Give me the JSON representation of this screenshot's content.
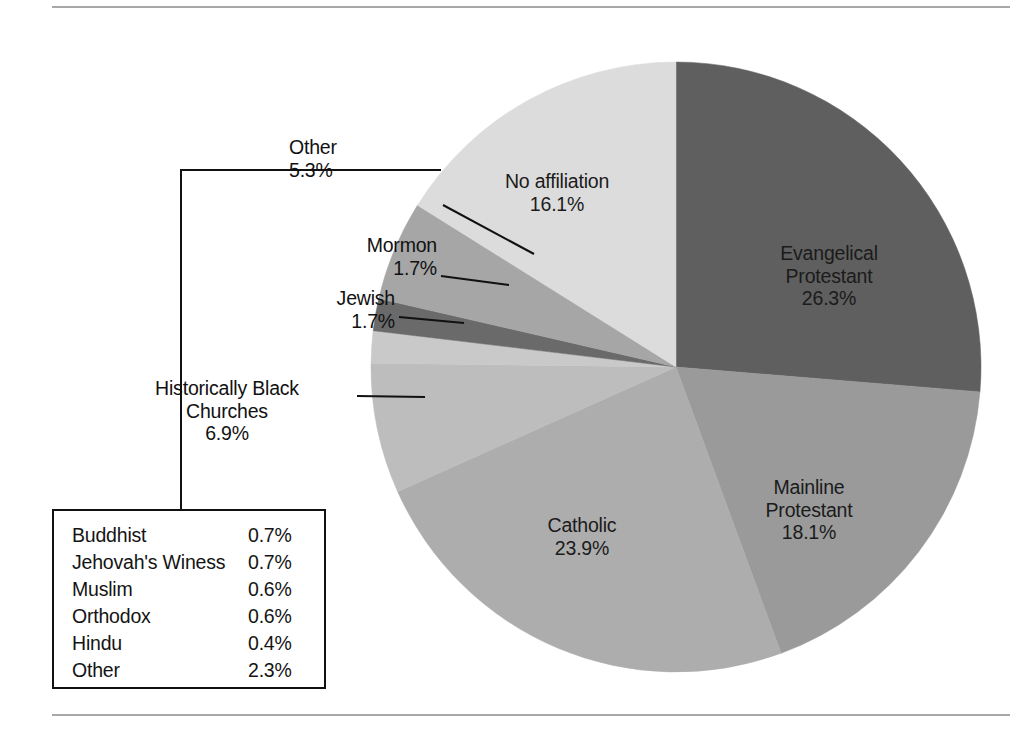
{
  "chart_data": {
    "type": "pie",
    "title": "",
    "start_angle_deg": 0,
    "direction": "clockwise",
    "center": {
      "x": 676,
      "y": 367
    },
    "radius": 305,
    "labels": [
      "Evangelical Protestant",
      "Mainline Protestant",
      "Catholic",
      "Historically Black Churches",
      "Jewish",
      "Mormon",
      "Other",
      "No affiliation"
    ],
    "values": [
      26.3,
      18.1,
      23.9,
      6.9,
      1.7,
      1.7,
      5.3,
      16.1
    ],
    "value_suffix": "%",
    "colors": [
      "#5f5f5f",
      "#9a9a9a",
      "#adadad",
      "#bdbdbd",
      "#c9c9c9",
      "#6a6a6a",
      "#a6a6a6",
      "#dcdcdc"
    ],
    "legend_position": "inside-slices-and-callouts",
    "grid": false,
    "sub_breakdown": {
      "parent": "Other",
      "rows": [
        {
          "label": "Buddhist",
          "value": "0.7%"
        },
        {
          "label": "Jehovah's Winess",
          "value": "0.7%"
        },
        {
          "label": "Muslim",
          "value": "0.6%"
        },
        {
          "label": "Orthodox",
          "value": "0.6%"
        },
        {
          "label": "Hindu",
          "value": "0.4%"
        },
        {
          "label": "Other",
          "value": "2.3%"
        }
      ]
    }
  },
  "slice_labels": {
    "no_affiliation": {
      "name": "No affiliation",
      "value": "16.1%"
    },
    "evangelical": {
      "line1": "Evangelical",
      "line2": "Protestant",
      "value": "26.3%"
    },
    "mainline": {
      "line1": "Mainline",
      "line2": "Protestant",
      "value": "18.1%"
    },
    "catholic": {
      "name": "Catholic",
      "value": "23.9%"
    }
  },
  "callouts": {
    "other": {
      "name": "Other",
      "value": "5.3%"
    },
    "mormon": {
      "name": "Mormon",
      "value": "1.7%"
    },
    "jewish": {
      "name": "Jewish",
      "value": "1.7%"
    },
    "black_churches": {
      "line1": "Historically Black",
      "line2": "Churches",
      "value": "6.9%"
    }
  },
  "colors": {
    "rule": "#a8a8a8",
    "text": "#1a1a1a",
    "leader_line": "#111111",
    "legend_border": "#111111"
  }
}
